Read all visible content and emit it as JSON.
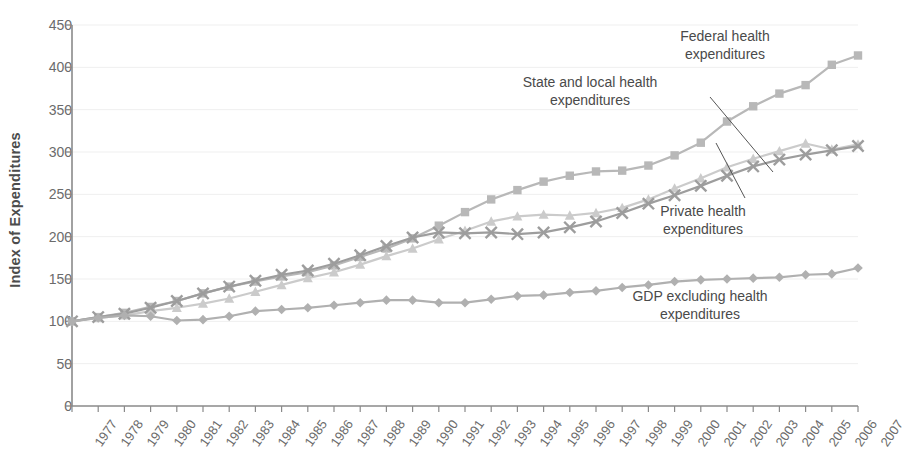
{
  "chart_data": {
    "type": "line",
    "title": "",
    "xlabel": "",
    "ylabel": "Index of Expenditures",
    "ylim": [
      0,
      450
    ],
    "yticks": [
      0,
      50,
      100,
      150,
      200,
      250,
      300,
      350,
      400,
      450
    ],
    "grid": "horizontal",
    "legend_position": "inline-annotations",
    "categories": [
      "1977",
      "1978",
      "1979",
      "1980",
      "1981",
      "1982",
      "1983",
      "1984",
      "1985",
      "1986",
      "1987",
      "1988",
      "1989",
      "1990",
      "1991",
      "1992",
      "1993",
      "1994",
      "1995",
      "1996",
      "1997",
      "1998",
      "1999",
      "2000",
      "2001",
      "2002",
      "2003",
      "2004",
      "2005",
      "2006",
      "2007"
    ],
    "series": [
      {
        "name": "Federal health expenditures",
        "marker": "square",
        "color": "#b8b8b8",
        "values": [
          100,
          105,
          110,
          117,
          124,
          133,
          141,
          147,
          153,
          158,
          166,
          176,
          186,
          198,
          213,
          229,
          244,
          255,
          265,
          272,
          277,
          278,
          284,
          296,
          311,
          336,
          354,
          369,
          379,
          403,
          414
        ]
      },
      {
        "name": "State and local health expenditures",
        "marker": "triangle",
        "color": "#cbcbcb",
        "values": [
          100,
          104,
          107,
          112,
          116,
          121,
          127,
          135,
          143,
          151,
          158,
          167,
          177,
          186,
          197,
          207,
          218,
          224,
          226,
          225,
          228,
          234,
          244,
          257,
          269,
          282,
          292,
          301,
          310,
          303,
          309
        ]
      },
      {
        "name": "Private health expenditures",
        "marker": "x",
        "color": "#9d9d9d",
        "values": [
          100,
          105,
          109,
          116,
          124,
          133,
          141,
          148,
          155,
          160,
          168,
          178,
          189,
          199,
          205,
          204,
          205,
          203,
          205,
          211,
          218,
          228,
          239,
          249,
          260,
          272,
          283,
          291,
          297,
          302,
          307
        ]
      },
      {
        "name": "GDP excluding health expenditures",
        "marker": "diamond",
        "color": "#b0b0b0",
        "values": [
          100,
          104,
          107,
          106,
          101,
          102,
          106,
          112,
          114,
          116,
          119,
          122,
          125,
          125,
          122,
          122,
          126,
          130,
          131,
          134,
          136,
          140,
          143,
          147,
          149,
          150,
          151,
          152,
          155,
          156,
          163
        ]
      }
    ],
    "annotations": [
      {
        "id": "federal",
        "text": "Federal health\nexpenditures",
        "align": "center",
        "x": 725,
        "y": 28
      },
      {
        "id": "state-local",
        "text": "State and local health\nexpenditures",
        "align": "center",
        "x": 590,
        "y": 74
      },
      {
        "id": "private",
        "text": "Private health\nexpenditures",
        "align": "center",
        "x": 703,
        "y": 203
      },
      {
        "id": "gdp",
        "text": "GDP excluding health\nexpenditures",
        "align": "center",
        "x": 700,
        "y": 288
      }
    ],
    "leader_lines": [
      {
        "id": "state-local-leader",
        "x1": 710,
        "y1": 97,
        "x2": 773,
        "y2": 172
      },
      {
        "id": "private-leader",
        "x1": 745,
        "y1": 198,
        "x2": 716,
        "y2": 143
      }
    ]
  },
  "axis": {
    "y_title": "Index of Expenditures",
    "y_tick_labels": [
      "450",
      "400",
      "350",
      "300",
      "250",
      "200",
      "150",
      "100",
      "50",
      "0"
    ],
    "x_tick_labels": [
      "1977",
      "1978",
      "1979",
      "1980",
      "1981",
      "1982",
      "1983",
      "1984",
      "1985",
      "1986",
      "1987",
      "1988",
      "1989",
      "1990",
      "1991",
      "1992",
      "1993",
      "1994",
      "1995",
      "1996",
      "1997",
      "1998",
      "1999",
      "2000",
      "2001",
      "2002",
      "2003",
      "2004",
      "2005",
      "2006",
      "2007"
    ]
  },
  "colors": {
    "axis": "#8a8a8a",
    "grid": "#efefef",
    "tick_text": "#6b6b6b",
    "annotation_text": "#4a4a4a",
    "federal": "#b8b8b8",
    "state_local": "#cbcbcb",
    "private": "#9d9d9d",
    "gdp": "#b0b0b0"
  }
}
